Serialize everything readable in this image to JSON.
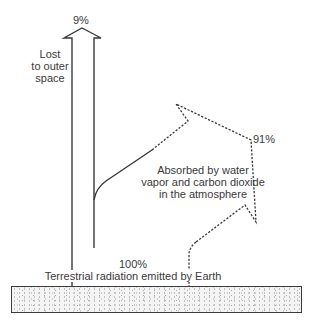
{
  "diagram": {
    "type": "energy-flow",
    "colors": {
      "line": "#3a3a3a",
      "text": "#3a3a3a",
      "ground_fill": "#f4f4f4"
    },
    "labels": {
      "lost_percent": "9%",
      "lost_line1": "Lost",
      "lost_line2": "to outer",
      "lost_line3": "space",
      "absorbed_percent": "91%",
      "absorbed_line1": "Absorbed by water",
      "absorbed_line2": "vapor and carbon dioxide",
      "absorbed_line3": "in the atmosphere",
      "emitted_percent": "100%",
      "emitted_caption": "Terrestrial radiation emitted by Earth"
    },
    "flows": [
      {
        "name": "lost-to-space",
        "percent": 9,
        "style": "solid",
        "direction": "up"
      },
      {
        "name": "absorbed-by-atmosphere",
        "percent": 91,
        "style": "solid-then-dashed",
        "direction": "up-right, returning down"
      },
      {
        "name": "terrestrial-emission",
        "percent": 100,
        "source": "Earth surface"
      }
    ]
  }
}
